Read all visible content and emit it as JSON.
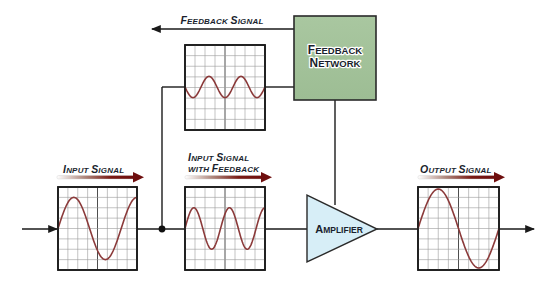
{
  "diagram": {
    "type": "feedback-amplifier-block-diagram",
    "colors": {
      "wire": "#1a1a1a",
      "wave": "#8b3a3a",
      "feedback_network_fill": "#a3c29a",
      "amplifier_fill": "#d7eef7",
      "label_arrow_start": "#ffffff",
      "label_arrow_end": "#7a1010",
      "text": "#1a1f2e"
    },
    "labels": {
      "feedback_signal": {
        "cap1": "F",
        "rest1": "EEDBACK ",
        "cap2": "S",
        "rest2": "IGNAL"
      },
      "input_signal": {
        "cap1": "I",
        "rest1": "NPUT ",
        "cap2": "S",
        "rest2": "IGNAL"
      },
      "input_with_feedback_line1": {
        "cap1": "I",
        "rest1": "NPUT ",
        "cap2": "S",
        "rest2": "IGNAL"
      },
      "input_with_feedback_line2": {
        "pre": "WITH ",
        "cap2": "F",
        "rest2": "EEDBACK"
      },
      "output_signal": {
        "cap1": "O",
        "rest1": "UTPUT ",
        "cap2": "S",
        "rest2": "IGNAL"
      }
    },
    "blocks": {
      "feedback_network": {
        "line1_cap": "F",
        "line1_rest": "EEDBACK",
        "line2_cap": "N",
        "line2_rest": "ETWORK"
      },
      "amplifier": {
        "cap": "A",
        "rest": "MPLIFIER"
      }
    },
    "scopes": [
      {
        "id": "input",
        "description": "Input Signal",
        "cycles": 1.25,
        "amplitude_cells": 3
      },
      {
        "id": "input-with-feedback",
        "description": "Input Signal with Feedback",
        "cycles": 2.25,
        "amplitude_cells": 2
      },
      {
        "id": "feedback",
        "description": "Feedback Signal",
        "cycles": 2.5,
        "amplitude_cells": 1
      },
      {
        "id": "output",
        "description": "Output Signal",
        "cycles": 1.0,
        "amplitude_cells": 3.8
      }
    ]
  }
}
